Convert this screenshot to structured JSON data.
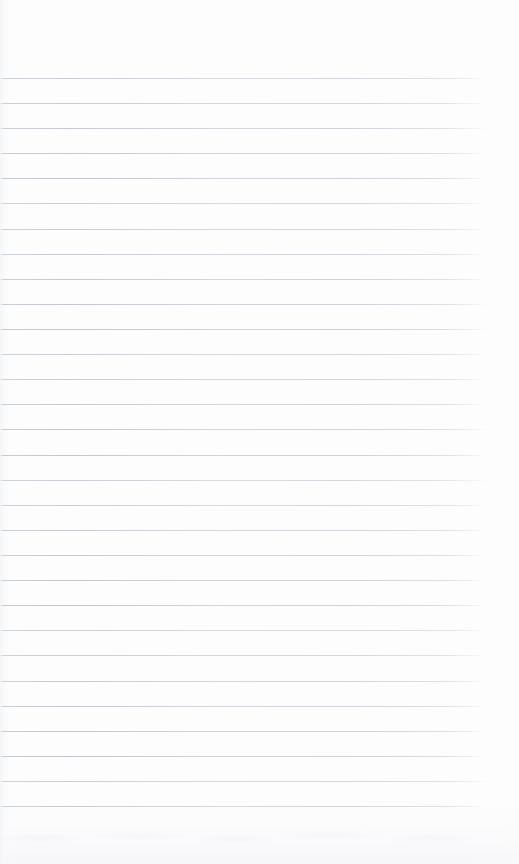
{
  "document": {
    "kind": "lined-notebook-page",
    "title": "",
    "page_width": 519,
    "page_height": 864,
    "background_color": "#fdfdfe",
    "has_visible_text": false,
    "written_content": ""
  },
  "ruling": {
    "line_color": "#969ca8",
    "line_count": 30,
    "first_line_y": 78,
    "line_spacing": 25.1,
    "line_start_x": 0,
    "line_end_x": 486,
    "line_thickness": 1,
    "orientation": "horizontal",
    "has_margin_rule": false,
    "margin_top": 78,
    "margin_right": 33,
    "margin_bottom": 58,
    "margin_left": 0
  },
  "lines": [
    {
      "index": 1,
      "y": 78,
      "text": ""
    },
    {
      "index": 2,
      "y": 103,
      "text": ""
    },
    {
      "index": 3,
      "y": 128,
      "text": ""
    },
    {
      "index": 4,
      "y": 153,
      "text": ""
    },
    {
      "index": 5,
      "y": 178,
      "text": ""
    },
    {
      "index": 6,
      "y": 203,
      "text": ""
    },
    {
      "index": 7,
      "y": 229,
      "text": ""
    },
    {
      "index": 8,
      "y": 254,
      "text": ""
    },
    {
      "index": 9,
      "y": 279,
      "text": ""
    },
    {
      "index": 10,
      "y": 304,
      "text": ""
    },
    {
      "index": 11,
      "y": 329,
      "text": ""
    },
    {
      "index": 12,
      "y": 354,
      "text": ""
    },
    {
      "index": 13,
      "y": 379,
      "text": ""
    },
    {
      "index": 14,
      "y": 404,
      "text": ""
    },
    {
      "index": 15,
      "y": 429,
      "text": ""
    },
    {
      "index": 16,
      "y": 455,
      "text": ""
    },
    {
      "index": 17,
      "y": 480,
      "text": ""
    },
    {
      "index": 18,
      "y": 505,
      "text": ""
    },
    {
      "index": 19,
      "y": 530,
      "text": ""
    },
    {
      "index": 20,
      "y": 555,
      "text": ""
    },
    {
      "index": 21,
      "y": 580,
      "text": ""
    },
    {
      "index": 22,
      "y": 605,
      "text": ""
    },
    {
      "index": 23,
      "y": 630,
      "text": ""
    },
    {
      "index": 24,
      "y": 655,
      "text": ""
    },
    {
      "index": 25,
      "y": 681,
      "text": ""
    },
    {
      "index": 26,
      "y": 706,
      "text": ""
    },
    {
      "index": 27,
      "y": 731,
      "text": ""
    },
    {
      "index": 28,
      "y": 756,
      "text": ""
    },
    {
      "index": 29,
      "y": 781,
      "text": ""
    },
    {
      "index": 30,
      "y": 806,
      "text": ""
    }
  ],
  "artifacts": {
    "bottom_shadow": true,
    "left_edge_shading": true,
    "scan_noise_color": "#eceef2"
  }
}
